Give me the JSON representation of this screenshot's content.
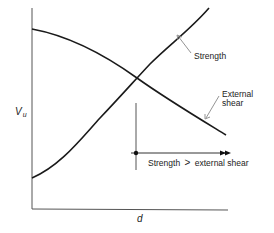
{
  "diagram": {
    "y_axis_label": "V",
    "y_axis_subscript": "u",
    "x_axis_label": "d",
    "curves": [
      {
        "name": "External shear",
        "label_line1": "External",
        "label_line2": "shear",
        "trend": "decreasing"
      },
      {
        "name": "Strength",
        "label": "Strength",
        "trend": "increasing"
      }
    ],
    "annotation": {
      "text_left": "Strength",
      "operator": ">",
      "text_right": "external shear"
    },
    "colors": {
      "line": "#1a1a1a",
      "axis": "#555555",
      "leader": "#888888"
    }
  }
}
